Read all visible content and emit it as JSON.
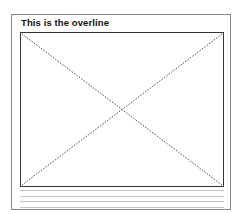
{
  "card": {
    "overline": "This is the overline",
    "media": {
      "icon": "image-placeholder-icon"
    },
    "text_lines": [
      1,
      2,
      3,
      4
    ]
  }
}
